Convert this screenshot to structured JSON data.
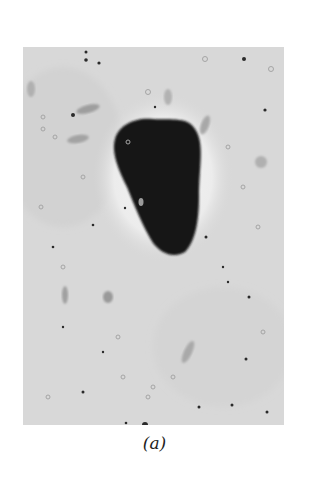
{
  "figure": {
    "panel_label": "(a)",
    "colors": {
      "background": "#ffffff",
      "field": "#d9d9d9",
      "particle": "#141414"
    }
  }
}
